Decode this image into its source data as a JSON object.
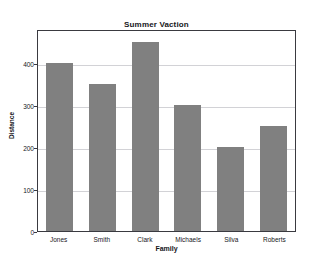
{
  "page": {
    "clipped_header_text": "statistics is a method that can reveal"
  },
  "chart_data": {
    "type": "bar",
    "title": "Summer Vaction",
    "xlabel": "Family",
    "ylabel": "Distance",
    "categories": [
      "Jones",
      "Smith",
      "Clark",
      "Michaels",
      "Silva",
      "Roberts"
    ],
    "values": [
      400,
      350,
      450,
      300,
      200,
      250
    ],
    "ylim": [
      0,
      480
    ],
    "yticks": [
      0,
      100,
      200,
      300,
      400
    ],
    "ytick_labels": [
      "0",
      "100",
      "200",
      "300",
      "400"
    ],
    "grid": true,
    "legend": false,
    "bar_color": "#808080",
    "frame_color": "#3a3a40",
    "grid_color": "#d2d2d6",
    "background_color": "#ffffff"
  }
}
